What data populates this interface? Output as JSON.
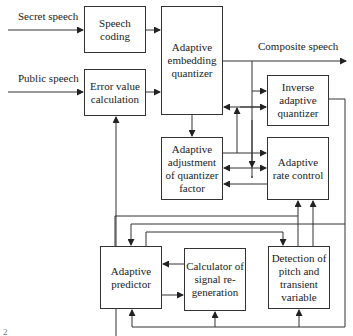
{
  "inputs": {
    "secret_speech": "Secret speech",
    "public_speech": "Public speech"
  },
  "outputs": {
    "composite_speech": "Composite speech"
  },
  "blocks": {
    "speech_coding": "Speech coding",
    "error_value_calculation": "Error value calculation",
    "adaptive_embedding_quantizer": "Adaptive embedding quantizer",
    "inverse_adaptive_quantizer": "Inverse adaptive quantizer",
    "adaptive_adjustment": "Adaptive adjustment of quantizer factor",
    "adaptive_rate_control": "Adaptive rate control",
    "adaptive_predictor": "Adaptive predictor",
    "signal_regeneration": "Calculator of signal re-generation",
    "pitch_detection": "Detection of pitch and transient variable"
  },
  "caption_fragment": "2"
}
